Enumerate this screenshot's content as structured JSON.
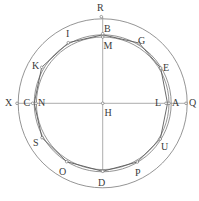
{
  "diagram": {
    "center": {
      "x": 102.7,
      "y": 103.3
    },
    "circles": [
      {
        "name": "outer-circle",
        "r": 84.5
      },
      {
        "name": "inner-circle-a",
        "r": 68.5
      },
      {
        "name": "inner-circle-b",
        "r": 66.3
      }
    ],
    "axes": {
      "horizontal": {
        "x1": 17,
        "x2": 186,
        "y": 103.3
      },
      "vertical": {
        "x": 102.7,
        "y1": 16.7,
        "y2": 171.3
      }
    },
    "polygon_points": "102.7,34.8 139,43 160.7,68 167.5,103.3 160.3,139 137.3,162 102.7,171.3 66.7,161.7 42,137.7 34.2,103.3 41.7,67.3 68.3,42.7",
    "points": [
      {
        "label": "R",
        "x": 101.3,
        "y": 16.7,
        "lx": 97,
        "ly": 11
      },
      {
        "label": "B",
        "x": 102.7,
        "y": 33.7,
        "lx": 104,
        "ly": 32
      },
      {
        "label": "M",
        "x": 102.7,
        "y": 37,
        "lx": 103.5,
        "ly": 49
      },
      {
        "label": "G",
        "x": 139,
        "y": 43,
        "lx": 138,
        "ly": 44
      },
      {
        "label": "E",
        "x": 160.7,
        "y": 68,
        "lx": 163,
        "ly": 71
      },
      {
        "label": "A",
        "x": 169,
        "y": 103.3,
        "lx": 172,
        "ly": 106
      },
      {
        "label": "L",
        "x": 166,
        "y": 103.3,
        "lx": 155,
        "ly": 106
      },
      {
        "label": "Q",
        "x": 186,
        "y": 103.3,
        "lx": 189,
        "ly": 106
      },
      {
        "label": "U",
        "x": 160.3,
        "y": 139,
        "lx": 161,
        "ly": 150
      },
      {
        "label": "P",
        "x": 137.3,
        "y": 162,
        "lx": 135,
        "ly": 176
      },
      {
        "label": "D",
        "x": 102.7,
        "y": 171.3,
        "lx": 98,
        "ly": 186
      },
      {
        "label": "O",
        "x": 66.7,
        "y": 161.7,
        "lx": 59,
        "ly": 175
      },
      {
        "label": "S",
        "x": 42,
        "y": 137.7,
        "lx": 33,
        "ly": 146
      },
      {
        "label": "N",
        "x": 36,
        "y": 103.3,
        "lx": 38,
        "ly": 106
      },
      {
        "label": "C",
        "x": 32.7,
        "y": 103.3,
        "lx": 23.5,
        "ly": 106
      },
      {
        "label": "X",
        "x": 17,
        "y": 103.3,
        "lx": 5,
        "ly": 106
      },
      {
        "label": "K",
        "x": 41.7,
        "y": 67.3,
        "lx": 32,
        "ly": 69
      },
      {
        "label": "I",
        "x": 68.3,
        "y": 42.7,
        "lx": 66,
        "ly": 37
      },
      {
        "label": "H",
        "x": 102.7,
        "y": 103.3,
        "lx": 104.5,
        "ly": 116
      }
    ]
  }
}
